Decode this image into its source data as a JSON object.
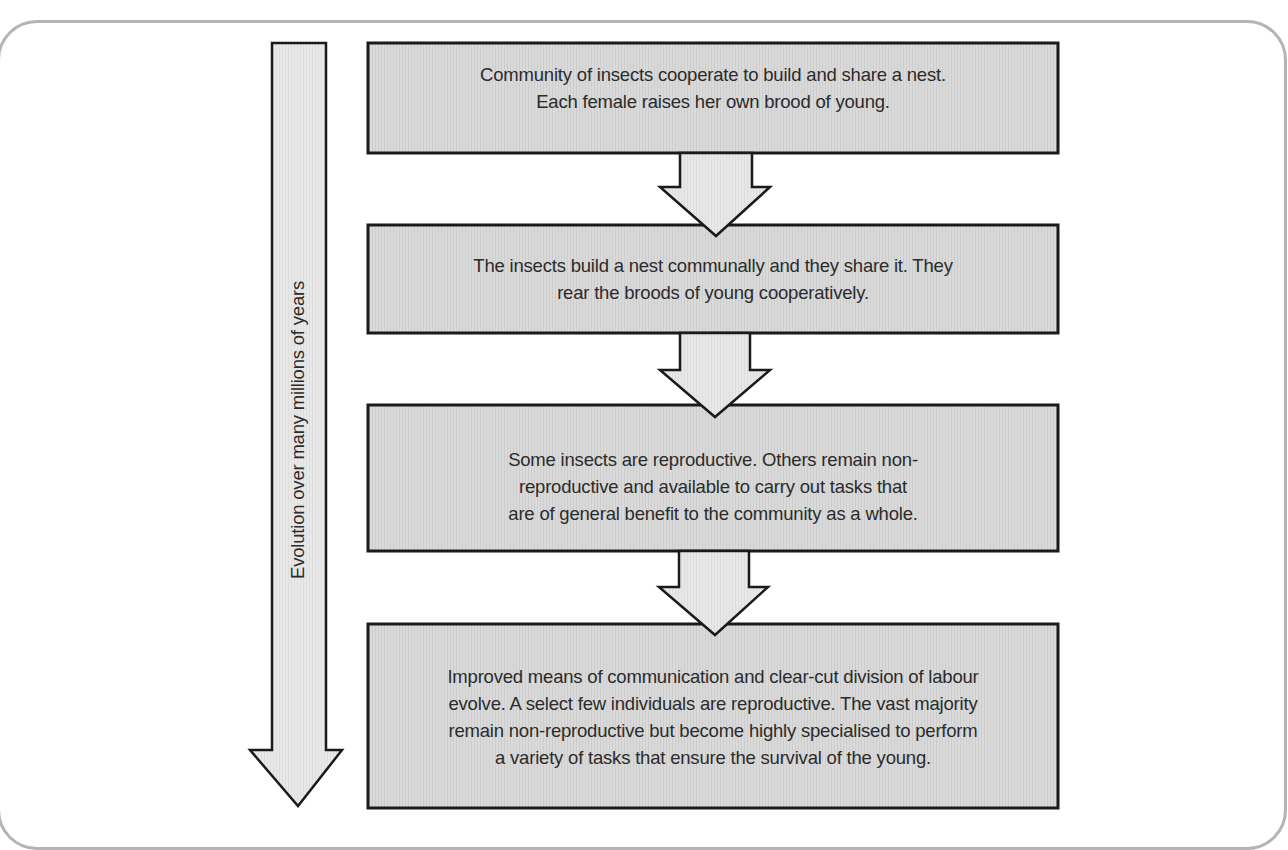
{
  "diagram": {
    "type": "flowchart",
    "timeline_label": "Evolution over many millions of years",
    "steps": [
      {
        "text": "Community of insects cooperate to build and share a nest.\nEach female raises her own brood of young."
      },
      {
        "text": "The insects build a nest communally and they share it. They\nrear the broods of young cooperatively."
      },
      {
        "text": "Some insects are reproductive. Others remain non-\nreproductive and available to carry out tasks that\nare of general benefit to the community as a whole."
      },
      {
        "text": "Improved means of communication and clear-cut division of labour\nevolve. A select few individuals are reproductive. The vast majority\nremain non-reproductive but become highly specialised to perform\na variety of tasks that ensure the survival of the young."
      }
    ],
    "colors": {
      "box_fill": "#d9d9d9",
      "arrow_fill": "#e6e6e6",
      "stroke": "#1a1a1a",
      "frame": "#b4b4b4"
    }
  }
}
